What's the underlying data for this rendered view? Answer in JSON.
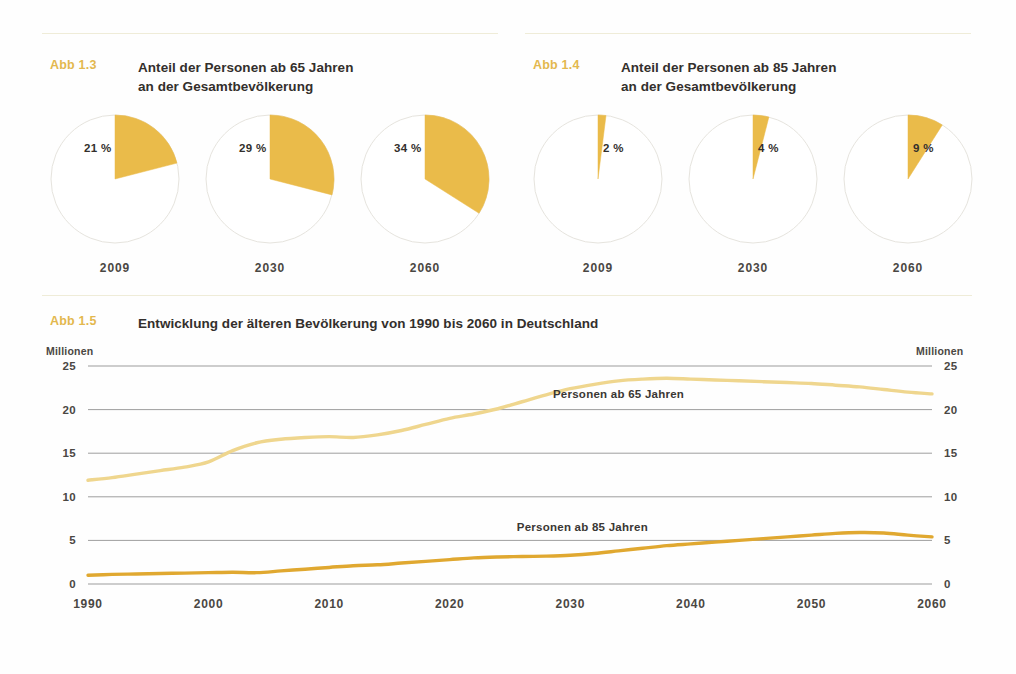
{
  "figures": {
    "abb13": {
      "tag": "Abb 1.3",
      "title": "Anteil der Personen ab 65 Jahren\nan der Gesamtbevölkerung"
    },
    "abb14": {
      "tag": "Abb 1.4",
      "title": "Anteil der Personen ab 85 Jahren\nan der Gesamtbevölkerung"
    },
    "abb15": {
      "tag": "Abb 1.5",
      "title": "Entwicklung der älteren Bevölkerung von 1990 bis 2060 in Deutschland"
    }
  },
  "colors": {
    "wedge": "#EABB4A",
    "pie_outline": "#E6E4DE",
    "line_65": "#EFD68E",
    "line_85": "#E0A830",
    "accent": "#E3B84E",
    "grid": "#8d8d8d",
    "divider": "#EFECD8",
    "text": "#332F2C"
  },
  "pies_65": {
    "type": "pie",
    "title": "Anteil der Personen ab 65 Jahren an der Gesamtbevölkerung",
    "items": [
      {
        "year": "2009",
        "value": 21,
        "label": "21 %"
      },
      {
        "year": "2030",
        "value": 29,
        "label": "29 %"
      },
      {
        "year": "2060",
        "value": 34,
        "label": "34 %"
      }
    ]
  },
  "pies_85": {
    "type": "pie",
    "title": "Anteil der Personen ab 85 Jahren an der Gesamtbevölkerung",
    "items": [
      {
        "year": "2009",
        "value": 2,
        "label": "2 %"
      },
      {
        "year": "2030",
        "value": 4,
        "label": "4 %"
      },
      {
        "year": "2060",
        "value": 9,
        "label": "9 %"
      }
    ]
  },
  "chart_data": {
    "type": "line",
    "title": "Entwicklung der älteren Bevölkerung von 1990 bis 2060 in Deutschland",
    "xlabel": "",
    "ylabel": "Millionen",
    "ylabel_right": "Millionen",
    "xlim": [
      1990,
      2060
    ],
    "ylim": [
      0,
      25
    ],
    "yticks": [
      0,
      5,
      10,
      15,
      20,
      25
    ],
    "ytick_labels": [
      "0",
      "5",
      "10",
      "15",
      "20",
      "25"
    ],
    "xticks": [
      1990,
      2000,
      2010,
      2020,
      2030,
      2040,
      2050,
      2060
    ],
    "xtick_labels": [
      "1990",
      "2000",
      "2010",
      "2020",
      "2030",
      "2040",
      "2050",
      "2060"
    ],
    "grid": true,
    "legend": "inline-annotations",
    "series": [
      {
        "name": "Personen ab 65 Jahren",
        "color": "#EFD68E",
        "x": [
          1990,
          1992,
          1994,
          1996,
          1998,
          2000,
          2002,
          2004,
          2006,
          2008,
          2010,
          2012,
          2014,
          2016,
          2018,
          2020,
          2022,
          2024,
          2026,
          2028,
          2030,
          2032,
          2034,
          2036,
          2038,
          2040,
          2042,
          2044,
          2046,
          2048,
          2050,
          2052,
          2054,
          2056,
          2058,
          2060
        ],
        "values": [
          11.9,
          12.2,
          12.6,
          13.0,
          13.4,
          14.0,
          15.3,
          16.2,
          16.6,
          16.8,
          16.9,
          16.8,
          17.1,
          17.6,
          18.3,
          19.0,
          19.5,
          20.1,
          20.9,
          21.7,
          22.4,
          22.9,
          23.3,
          23.5,
          23.6,
          23.5,
          23.4,
          23.3,
          23.2,
          23.1,
          23.0,
          22.8,
          22.6,
          22.3,
          22.0,
          21.8
        ]
      },
      {
        "name": "Personen ab 85 Jahren",
        "color": "#E0A830",
        "x": [
          1990,
          1992,
          1994,
          1996,
          1998,
          2000,
          2002,
          2004,
          2006,
          2008,
          2010,
          2012,
          2014,
          2016,
          2018,
          2020,
          2022,
          2024,
          2026,
          2028,
          2030,
          2032,
          2034,
          2036,
          2038,
          2040,
          2042,
          2044,
          2046,
          2048,
          2050,
          2052,
          2054,
          2056,
          2058,
          2060
        ],
        "values": [
          1.0,
          1.1,
          1.15,
          1.2,
          1.25,
          1.3,
          1.35,
          1.3,
          1.5,
          1.7,
          1.9,
          2.1,
          2.2,
          2.4,
          2.6,
          2.8,
          3.0,
          3.1,
          3.15,
          3.2,
          3.3,
          3.5,
          3.8,
          4.1,
          4.4,
          4.6,
          4.8,
          5.0,
          5.2,
          5.4,
          5.6,
          5.8,
          5.9,
          5.85,
          5.6,
          5.4
        ]
      }
    ],
    "annotations": [
      {
        "text": "Personen ab 65 Jahren",
        "x": 2034,
        "y": 21.3
      },
      {
        "text": "Personen ab 85 Jahren",
        "x": 2031,
        "y": 6.1
      }
    ]
  }
}
